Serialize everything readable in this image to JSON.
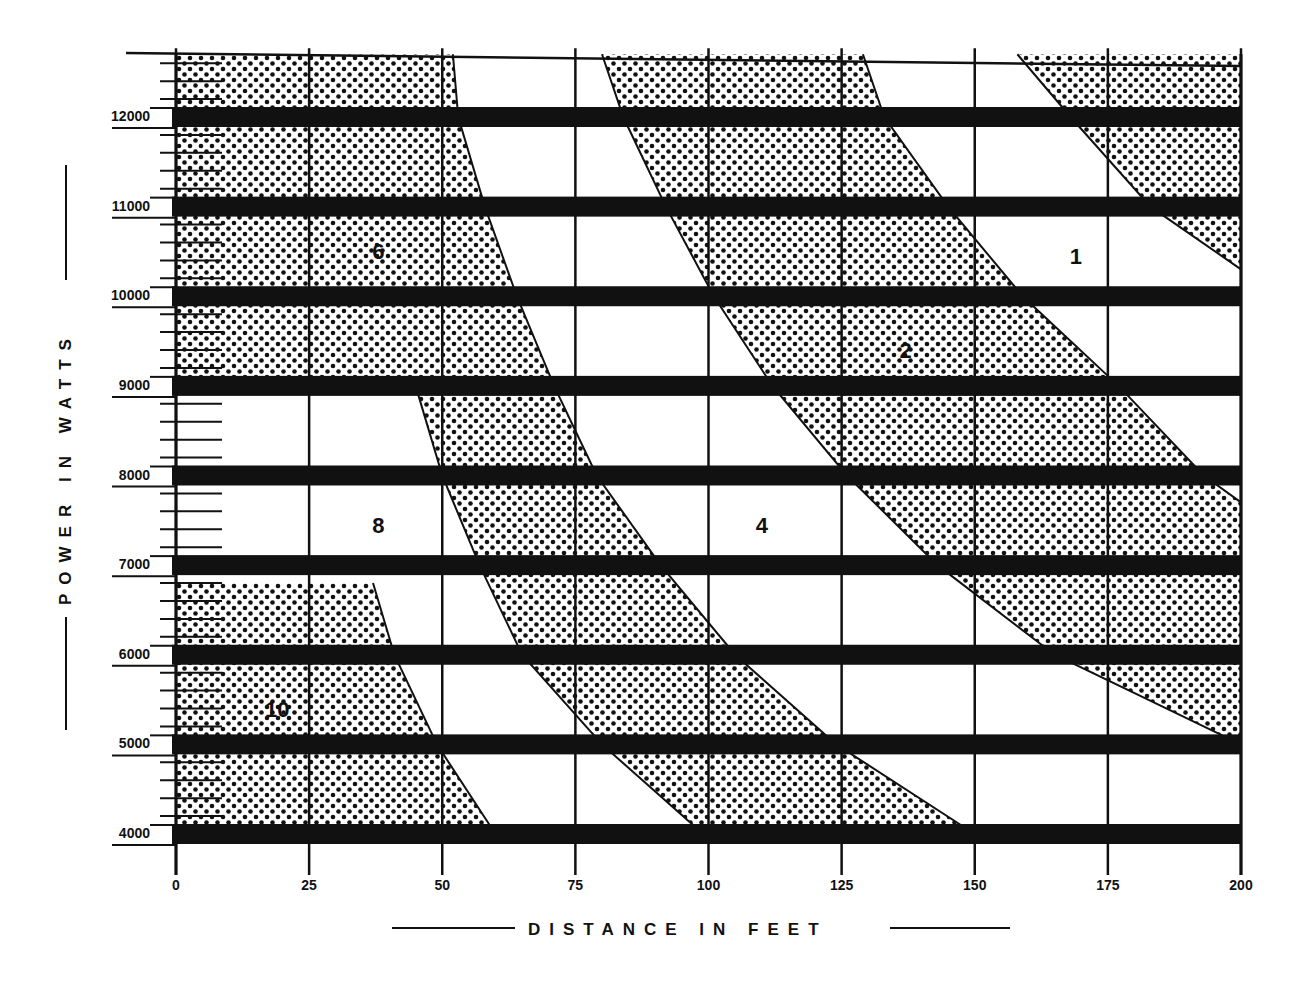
{
  "chart_data": {
    "type": "area",
    "title": "",
    "xlabel": "DISTANCE IN FEET",
    "ylabel": "POWER IN WATTS",
    "xlim": [
      0,
      200
    ],
    "ylim": [
      3900,
      12700
    ],
    "x_ticks": [
      0,
      25,
      50,
      75,
      100,
      125,
      150,
      175,
      200
    ],
    "x_tick_labels": [
      "0",
      "25",
      "50",
      "75",
      "100",
      "125",
      "150",
      "175",
      "200"
    ],
    "y_ticks": [
      4000,
      5000,
      6000,
      7000,
      8000,
      9000,
      10000,
      11000,
      12000
    ],
    "y_tick_labels": [
      "4000",
      "5000",
      "6000",
      "7000",
      "8000",
      "9000",
      "10000",
      "11000",
      "12000"
    ],
    "grid": true,
    "legend": "none",
    "power_bars": [
      12000,
      11000,
      10000,
      9000,
      8000,
      7000,
      6000,
      5000,
      4000
    ],
    "zone_labels": [
      {
        "label": "10",
        "x": 19,
        "y": 5400
      },
      {
        "label": "8",
        "x": 38,
        "y": 7450
      },
      {
        "label": "6",
        "x": 38,
        "y": 10500
      },
      {
        "label": "4",
        "x": 110,
        "y": 7450
      },
      {
        "label": "2",
        "x": 137,
        "y": 9400
      },
      {
        "label": "1",
        "x": 169,
        "y": 10450
      }
    ],
    "boundary_curves": [
      {
        "name": "zone-10-edge",
        "points": [
          [
            37,
            6800
          ],
          [
            41,
            6000
          ],
          [
            49,
            5000
          ],
          [
            60,
            4000
          ]
        ]
      },
      {
        "name": "zone-8-edge",
        "points": [
          [
            45,
            9000
          ],
          [
            50,
            8000
          ],
          [
            57,
            7000
          ],
          [
            65,
            6000
          ],
          [
            80,
            5000
          ],
          [
            99,
            4000
          ]
        ]
      },
      {
        "name": "zone-6-edge",
        "points": [
          [
            52,
            12700
          ],
          [
            53,
            12000
          ],
          [
            58,
            11000
          ],
          [
            64,
            10000
          ],
          [
            71,
            9000
          ],
          [
            79,
            8000
          ],
          [
            91,
            7000
          ],
          [
            105,
            6000
          ],
          [
            124,
            5000
          ],
          [
            150,
            4000
          ]
        ]
      },
      {
        "name": "zone-4-edge",
        "points": [
          [
            80,
            12700
          ],
          [
            84,
            12000
          ],
          [
            92,
            11000
          ],
          [
            101,
            10000
          ],
          [
            112,
            9000
          ],
          [
            126,
            8000
          ],
          [
            143,
            7000
          ],
          [
            165,
            6000
          ],
          [
            200,
            5000
          ]
        ]
      },
      {
        "name": "zone-2-edge",
        "points": [
          [
            129,
            12700
          ],
          [
            133,
            12000
          ],
          [
            145,
            11000
          ],
          [
            159,
            10000
          ],
          [
            177,
            9000
          ],
          [
            193,
            8000
          ],
          [
            200,
            7700
          ]
        ]
      },
      {
        "name": "zone-1-edge",
        "points": [
          [
            158,
            12700
          ],
          [
            168,
            12000
          ],
          [
            183,
            11000
          ],
          [
            200,
            10300
          ]
        ]
      }
    ]
  }
}
